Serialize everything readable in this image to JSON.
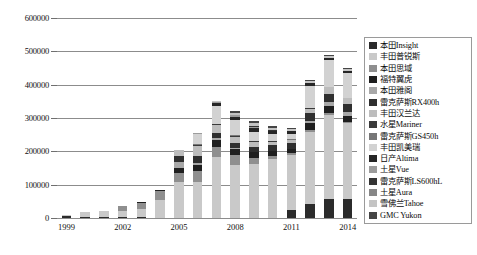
{
  "chart_data": {
    "type": "bar",
    "stacked": true,
    "title": "",
    "subtitle": "",
    "xlabel": "",
    "ylabel": "",
    "grid": true,
    "legend_position": "right",
    "ylim": [
      0,
      600000
    ],
    "yticks": [
      "0",
      "100000",
      "200000",
      "300000",
      "400000",
      "500000",
      "600000"
    ],
    "ytick_values": [
      0,
      100000,
      200000,
      300000,
      400000,
      500000,
      600000
    ],
    "x": [
      "1999",
      "2000",
      "2001",
      "2002",
      "2003",
      "2004",
      "2005",
      "2006",
      "2007",
      "2008",
      "2009",
      "2010",
      "2011",
      "2012",
      "2013",
      "2014"
    ],
    "xtick_labels": [
      "1999",
      "2002",
      "2005",
      "2008",
      "2011",
      "2014"
    ],
    "xtick_index": [
      0,
      3,
      6,
      9,
      12,
      15
    ],
    "totals": [
      10000,
      18000,
      22000,
      37000,
      48000,
      85000,
      205000,
      255000,
      350000,
      320000,
      290000,
      275000,
      270000,
      415000,
      490000,
      450000
    ],
    "series": [
      {
        "name": "本田Insight",
        "color": "#2b2b2b",
        "values": [
          5000,
          4000,
          3500,
          2500,
          2000,
          1200,
          700,
          600,
          400,
          300,
          200,
          150,
          20000,
          28000,
          32000,
          30000
        ]
      },
      {
        "name": "丰田普锐斯",
        "color": "#c9c9c9",
        "values": [
          5000,
          14000,
          18500,
          20000,
          24000,
          54000,
          108000,
          107000,
          182000,
          158000,
          139000,
          140000,
          136000,
          147000,
          145000,
          122000
        ]
      },
      {
        "name": "本田思域",
        "color": "#8f8f8f",
        "values": [
          0,
          0,
          0,
          13000,
          20000,
          26000,
          26000,
          31000,
          32000,
          31000,
          15000,
          7300,
          5000,
          4000,
          3000,
          2000
        ]
      },
      {
        "name": "福特翼虎",
        "color": "#1f1f1f",
        "values": [
          0,
          0,
          0,
          1500,
          2000,
          3800,
          18000,
          20000,
          21000,
          18000,
          15000,
          11000,
          11000,
          14000,
          12000,
          10000
        ]
      },
      {
        "name": "本田雅阁",
        "color": "#a8a8a8",
        "values": [
          0,
          0,
          0,
          0,
          0,
          0,
          16000,
          5000,
          3400,
          1500,
          600,
          300,
          200,
          6000,
          8000,
          7000
        ]
      },
      {
        "name": "雷克萨斯RX400h",
        "color": "#2f2f2f",
        "values": [
          0,
          0,
          0,
          0,
          0,
          0,
          20000,
          20000,
          17000,
          15000,
          14000,
          15000,
          14000,
          15000,
          14000,
          12000
        ]
      },
      {
        "name": "丰田汉兰达",
        "color": "#bdbdbd",
        "values": [
          0,
          0,
          0,
          0,
          0,
          0,
          17000,
          31000,
          22000,
          20000,
          12000,
          8000,
          7000,
          9000,
          11000,
          10000
        ]
      },
      {
        "name": "水星Mariner",
        "color": "#3a3a3a",
        "values": [
          0,
          0,
          0,
          0,
          0,
          0,
          1000,
          3000,
          3000,
          3500,
          3000,
          2000,
          1000,
          800,
          600,
          400
        ]
      },
      {
        "name": "雷克萨斯GS450h",
        "color": "#777777",
        "values": [
          0,
          0,
          0,
          0,
          0,
          0,
          0,
          1800,
          1600,
          1200,
          900,
          700,
          600,
          500,
          400,
          300
        ]
      },
      {
        "name": "丰田凯美瑞",
        "color": "#d2d2d2",
        "values": [
          0,
          0,
          0,
          0,
          0,
          0,
          0,
          31000,
          54000,
          46000,
          23000,
          15000,
          14000,
          46000,
          45000,
          40000
        ]
      },
      {
        "name": "日产Altima",
        "color": "#262626",
        "values": [
          0,
          0,
          0,
          0,
          0,
          0,
          0,
          0,
          8400,
          9000,
          9400,
          7000,
          6000,
          5000,
          4000,
          3000
        ]
      },
      {
        "name": "土星Vue",
        "color": "#9c9c9c",
        "values": [
          0,
          0,
          0,
          0,
          0,
          0,
          0,
          2000,
          3000,
          4000,
          3000,
          1500,
          500,
          400,
          300,
          200
        ]
      },
      {
        "name": "雷克萨斯LS600hL",
        "color": "#343434",
        "values": [
          0,
          0,
          0,
          0,
          0,
          0,
          0,
          0,
          900,
          1000,
          800,
          600,
          500,
          400,
          300,
          200
        ]
      },
      {
        "name": "土星Aura",
        "color": "#878787",
        "values": [
          0,
          0,
          0,
          0,
          0,
          0,
          0,
          0,
          800,
          1200,
          900,
          500,
          300,
          200,
          150,
          100
        ]
      },
      {
        "name": "雪佛兰Tahoe",
        "color": "#c4c4c4",
        "values": [
          0,
          0,
          0,
          0,
          0,
          0,
          0,
          0,
          500,
          6000,
          7000,
          5000,
          4000,
          3500,
          3000,
          2500
        ]
      },
      {
        "name": "GMC Yukon",
        "color": "#454545",
        "values": [
          0,
          0,
          0,
          0,
          0,
          0,
          0,
          0,
          0,
          4000,
          5000,
          4000,
          3000,
          2500,
          2000,
          1500
        ]
      }
    ]
  },
  "legend": {
    "items": [
      {
        "label": "本田Insight"
      },
      {
        "label": "丰田普锐斯"
      },
      {
        "label": "本田思域"
      },
      {
        "label": "福特翼虎"
      },
      {
        "label": "本田雅阁"
      },
      {
        "label": "雷克萨斯RX400h"
      },
      {
        "label": "丰田汉兰达"
      },
      {
        "label": "水星Mariner"
      },
      {
        "label": "雷克萨斯GS450h"
      },
      {
        "label": "丰田凯美瑞"
      },
      {
        "label": "日产Altima"
      },
      {
        "label": "土星Vue"
      },
      {
        "label": "雷克萨斯LS600hL"
      },
      {
        "label": "土星Aura"
      },
      {
        "label": "雪佛兰Tahoe"
      },
      {
        "label": "GMC Yukon"
      }
    ]
  }
}
